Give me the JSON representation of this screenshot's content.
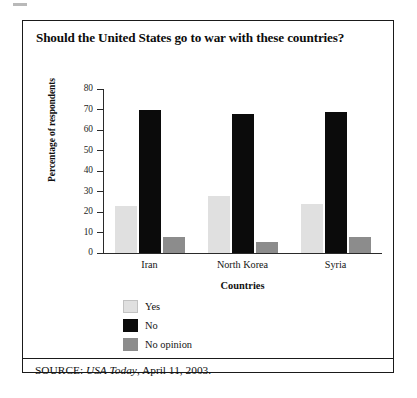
{
  "figure": {
    "title": "Should the United States go to war with these countries?",
    "source_prefix": "SOURCE: ",
    "source_italic": "USA Today",
    "source_suffix": ", April 11, 2003."
  },
  "chart_data": {
    "type": "bar",
    "title": "Should the United States go to war with these countries?",
    "xlabel": "Countries",
    "ylabel": "Percentage of respondents",
    "categories": [
      "Iran",
      "North Korea",
      "Syria"
    ],
    "series": [
      {
        "name": "Yes",
        "color": "#e0e0e0",
        "values": [
          23,
          28,
          24
        ]
      },
      {
        "name": "No",
        "color": "#0b0b0b",
        "values": [
          70,
          68,
          69
        ]
      },
      {
        "name": "No opinion",
        "color": "#8c8c8c",
        "values": [
          8,
          5.5,
          8
        ]
      }
    ],
    "ylim": [
      0,
      80
    ],
    "yticks": [
      0,
      10,
      20,
      30,
      40,
      50,
      60,
      70,
      80
    ],
    "ytick_labels": [
      "0",
      "10",
      "20",
      "30",
      "40",
      "50",
      "60",
      "70",
      "80"
    ],
    "grid": false,
    "legend_position": "below-left"
  }
}
